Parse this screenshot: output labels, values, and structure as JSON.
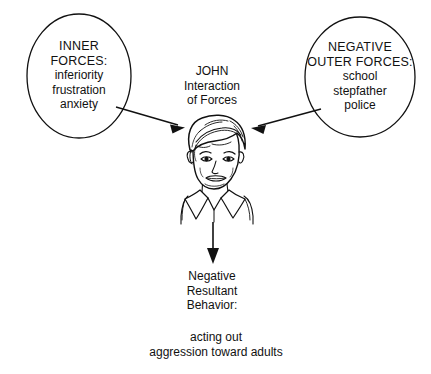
{
  "diagram": {
    "title_center": {
      "lines": [
        "JOHN",
        "Interaction",
        "of Forces"
      ]
    },
    "left_node": {
      "shape": "ellipse",
      "heading_lines": [
        "INNER",
        "FORCES:"
      ],
      "item_lines": [
        "inferiority",
        "frustration",
        "anxiety"
      ]
    },
    "right_node": {
      "shape": "ellipse",
      "heading_lines": [
        "NEGATIVE",
        "OUTER FORCES:"
      ],
      "item_lines": [
        "school",
        "stepfather",
        "police"
      ]
    },
    "center_figure": {
      "icon": "boy-face-illustration",
      "description": "line drawing of a boy's head and collared shirt"
    },
    "outcome": {
      "heading_lines": [
        "Negative",
        "Resultant",
        "Behavior:"
      ],
      "detail_lines": [
        "acting out",
        "aggression toward adults"
      ]
    },
    "arrows": [
      {
        "name": "arrow-left-to-center",
        "direction": "right-down"
      },
      {
        "name": "arrow-right-to-center",
        "direction": "left-down"
      },
      {
        "name": "arrow-center-to-outcome",
        "direction": "down"
      }
    ],
    "colors": {
      "stroke": "#111111",
      "text": "#111111",
      "background": "#ffffff"
    }
  }
}
